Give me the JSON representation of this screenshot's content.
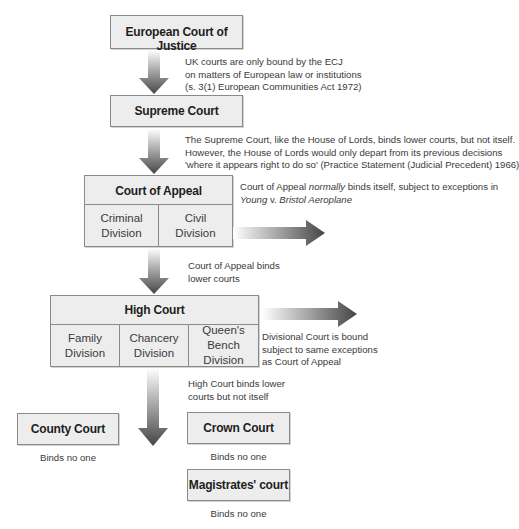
{
  "diagram": {
    "nodes": {
      "ecj": {
        "label": "European Court of Justice"
      },
      "supreme": {
        "label": "Supreme Court"
      },
      "appeal": {
        "label": "Court of Appeal",
        "divisions": [
          {
            "line1": "Criminal",
            "line2": "Division"
          },
          {
            "line1": "Civil",
            "line2": "Division"
          }
        ]
      },
      "high": {
        "label": "High Court",
        "divisions": [
          {
            "line1": "Family",
            "line2": "Division"
          },
          {
            "line1": "Chancery",
            "line2": "Division"
          },
          {
            "line1": "Queen's Bench",
            "line2": "Division"
          }
        ]
      },
      "county": {
        "label": "County Court",
        "caption": "Binds no one"
      },
      "crown": {
        "label": "Crown Court",
        "caption": "Binds no one"
      },
      "magistrates": {
        "label": "Magistrates' court",
        "caption": "Binds no one"
      }
    },
    "notes": {
      "ecj_to_supreme": [
        "UK courts are only bound by the ECJ",
        "on matters of European law or institutions",
        "(s. 3(1) European Communities Act 1972)"
      ],
      "supreme_to_appeal": [
        "The Supreme Court, like the House of Lords, binds lower courts, but not itself.",
        "However, the House of Lords would only depart from its previous decisions",
        "'where it appears right to do so' (Practice Statement (Judicial Precedent) 1966)"
      ],
      "appeal_self": {
        "prefix": "Court of Appeal ",
        "emph": "normally",
        "suffix": " binds itself, subject to exceptions in",
        "case_a": "Young",
        "case_v": " v. ",
        "case_b": "Bristol Aeroplane"
      },
      "appeal_to_high": [
        "Court of Appeal binds",
        "lower courts"
      ],
      "divisional": [
        "Divisional Court is bound",
        "subject to same exceptions",
        "as Court of Appeal"
      ],
      "high_to_lower": [
        "High Court binds lower",
        "courts but not itself"
      ]
    },
    "colors": {
      "box_fill": "#ededed",
      "box_border": "#8a8a8a",
      "arrow_dark": "#4a4a4a",
      "arrow_light": "#ffffff"
    }
  }
}
